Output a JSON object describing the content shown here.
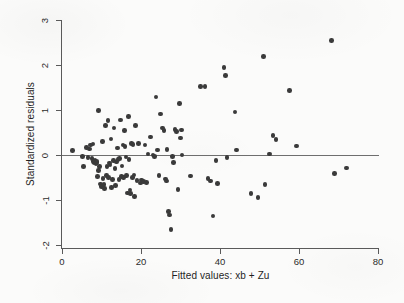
{
  "chart_data": {
    "type": "scatter",
    "title": "",
    "xlabel": "Fitted values: xb + Zu",
    "ylabel": "Standardized residuals",
    "xlim": [
      0,
      80
    ],
    "ylim": [
      -2,
      3.2
    ],
    "xticks": [
      0,
      20,
      40,
      60,
      80
    ],
    "xtick_labels": [
      "0",
      "20",
      "40",
      "60",
      "80"
    ],
    "yticks": [
      -2,
      -1,
      0,
      1,
      2,
      3
    ],
    "ytick_labels": [
      "-2",
      "-1",
      "0",
      "1",
      "2",
      "3"
    ],
    "grid": false,
    "legend": null,
    "annotations": [
      {
        "type": "reference-line",
        "orientation": "horizontal",
        "y": 0,
        "label": "zero residual line"
      }
    ],
    "marker": {
      "shape": "circle",
      "color": "#3a3a3a",
      "size": 4.6
    },
    "n_points": 120,
    "points": [
      [
        2.6,
        0.1
      ],
      [
        5.2,
        -0.03
      ],
      [
        5.4,
        -0.26
      ],
      [
        6.2,
        0.17
      ],
      [
        6.6,
        -0.06
      ],
      [
        7.0,
        0.13
      ],
      [
        7.2,
        0.22
      ],
      [
        7.6,
        -0.08
      ],
      [
        7.8,
        0.24
      ],
      [
        8.0,
        -0.14
      ],
      [
        8.1,
        -0.18
      ],
      [
        8.3,
        -0.16
      ],
      [
        8.4,
        -0.12
      ],
      [
        8.6,
        -0.2
      ],
      [
        8.7,
        -0.15
      ],
      [
        8.9,
        -0.17
      ],
      [
        9.0,
        -0.48
      ],
      [
        9.2,
        0.99
      ],
      [
        9.3,
        -0.35
      ],
      [
        9.5,
        -0.25
      ],
      [
        9.8,
        -0.64
      ],
      [
        10.0,
        -0.7
      ],
      [
        10.2,
        0.3
      ],
      [
        10.4,
        -0.52
      ],
      [
        10.6,
        -0.66
      ],
      [
        10.8,
        -0.74
      ],
      [
        11.0,
        0.65
      ],
      [
        11.2,
        -0.45
      ],
      [
        11.4,
        -0.26
      ],
      [
        11.6,
        0.77
      ],
      [
        11.8,
        -0.5
      ],
      [
        12.0,
        -0.18
      ],
      [
        12.2,
        -0.22
      ],
      [
        12.4,
        0.36
      ],
      [
        12.6,
        -0.72
      ],
      [
        12.8,
        -0.55
      ],
      [
        13.0,
        -0.12
      ],
      [
        13.2,
        0.6
      ],
      [
        13.4,
        -0.3
      ],
      [
        13.6,
        -0.68
      ],
      [
        13.8,
        -0.16
      ],
      [
        14.0,
        0.16
      ],
      [
        14.2,
        -0.1
      ],
      [
        14.4,
        -0.54
      ],
      [
        14.6,
        -0.08
      ],
      [
        14.8,
        0.78
      ],
      [
        15.0,
        -0.48
      ],
      [
        15.2,
        -0.24
      ],
      [
        15.4,
        0.22
      ],
      [
        15.6,
        -0.5
      ],
      [
        15.8,
        0.54
      ],
      [
        16.0,
        0.19
      ],
      [
        16.2,
        -0.04
      ],
      [
        16.4,
        -0.46
      ],
      [
        16.6,
        -0.84
      ],
      [
        16.8,
        0.85
      ],
      [
        17.0,
        -0.1
      ],
      [
        17.2,
        -0.78
      ],
      [
        17.4,
        -0.86
      ],
      [
        17.6,
        0.25
      ],
      [
        17.8,
        -0.5
      ],
      [
        18.0,
        0.23
      ],
      [
        18.2,
        -0.44
      ],
      [
        18.4,
        -0.92
      ],
      [
        18.6,
        0.66
      ],
      [
        19.0,
        -0.57
      ],
      [
        19.4,
        0.26
      ],
      [
        19.8,
        -0.62
      ],
      [
        20.2,
        -0.56
      ],
      [
        20.6,
        -0.59
      ],
      [
        21.0,
        0.22
      ],
      [
        21.4,
        -0.61
      ],
      [
        21.8,
        0.02
      ],
      [
        22.4,
        0.4
      ],
      [
        23.0,
        0.0
      ],
      [
        23.4,
        -0.03
      ],
      [
        23.8,
        1.29
      ],
      [
        24.2,
        0.11
      ],
      [
        24.6,
        -0.45
      ],
      [
        25.0,
        0.91
      ],
      [
        25.4,
        0.6
      ],
      [
        25.8,
        0.55
      ],
      [
        26.2,
        -0.53
      ],
      [
        26.4,
        -0.58
      ],
      [
        26.6,
        0.12
      ],
      [
        27.0,
        -1.26
      ],
      [
        27.2,
        -1.33
      ],
      [
        27.6,
        -1.65
      ],
      [
        28.0,
        -0.03
      ],
      [
        28.2,
        -0.17
      ],
      [
        28.6,
        0.57
      ],
      [
        29.0,
        0.52
      ],
      [
        29.4,
        -0.77
      ],
      [
        29.8,
        1.14
      ],
      [
        30.0,
        0.38
      ],
      [
        30.2,
        0.56
      ],
      [
        30.4,
        0.0
      ],
      [
        32.6,
        -0.47
      ],
      [
        35.0,
        1.52
      ],
      [
        36.2,
        1.52
      ],
      [
        37.0,
        -0.52
      ],
      [
        37.6,
        -0.58
      ],
      [
        38.2,
        -1.36
      ],
      [
        39.0,
        -0.12
      ],
      [
        39.4,
        -0.63
      ],
      [
        41.0,
        1.94
      ],
      [
        41.4,
        1.77
      ],
      [
        41.8,
        -0.05
      ],
      [
        43.8,
        0.96
      ],
      [
        44.2,
        0.11
      ],
      [
        47.8,
        -0.86
      ],
      [
        49.6,
        -0.94
      ],
      [
        51.0,
        2.19
      ],
      [
        51.4,
        -0.65
      ],
      [
        52.6,
        0.02
      ],
      [
        53.4,
        0.43
      ],
      [
        54.2,
        0.35
      ],
      [
        57.6,
        1.43
      ],
      [
        59.4,
        0.2
      ],
      [
        68.2,
        2.54
      ],
      [
        69.0,
        -0.41
      ],
      [
        72.0,
        -0.29
      ]
    ]
  }
}
